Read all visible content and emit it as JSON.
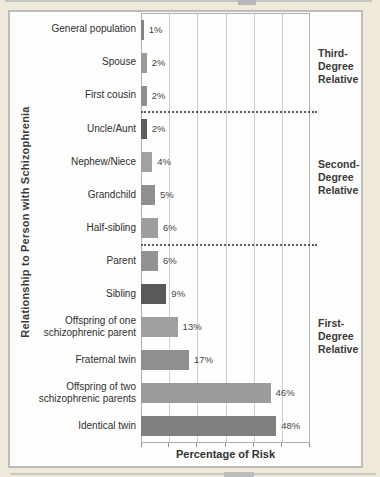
{
  "figure": {
    "page_background": "#efe9da",
    "panel_background": "#fdfdfb",
    "frame_border_color": "#bcbcbc",
    "gridline_color": "#cfcfcf"
  },
  "chart_data": {
    "type": "bar",
    "orientation": "horizontal",
    "title": "",
    "xlabel": "Percentage of Risk",
    "ylabel": "Relationship to Person with Schizophrenia",
    "xlim": [
      0,
      60
    ],
    "grid": true,
    "gridline_interval": 10,
    "axis_tick_labels_shown": false,
    "rows": [
      {
        "label": "General population",
        "value": 1,
        "value_label": "1%",
        "color": "#848484"
      },
      {
        "label": "Spouse",
        "value": 2,
        "value_label": "2%",
        "color": "#9b9b9b"
      },
      {
        "label": "First cousin",
        "value": 2,
        "value_label": "2%",
        "color": "#8e8e8e"
      },
      {
        "label": "Uncle/Aunt",
        "value": 2,
        "value_label": "2%",
        "color": "#5d5d5d"
      },
      {
        "label": "Nephew/Niece",
        "value": 4,
        "value_label": "4%",
        "color": "#a1a1a1"
      },
      {
        "label": "Grandchild",
        "value": 5,
        "value_label": "5%",
        "color": "#8f8f8f"
      },
      {
        "label": "Half-sibling",
        "value": 6,
        "value_label": "6%",
        "color": "#9d9d9d"
      },
      {
        "label": "Parent",
        "value": 6,
        "value_label": "6%",
        "color": "#929292"
      },
      {
        "label": "Sibling",
        "value": 9,
        "value_label": "9%",
        "color": "#595959"
      },
      {
        "label": "Offspring of one\nschizophrenic parent",
        "value": 13,
        "value_label": "13%",
        "color": "#a0a0a0"
      },
      {
        "label": "Fraternal twin",
        "value": 17,
        "value_label": "17%",
        "color": "#8f8f8f"
      },
      {
        "label": "Offspring of two\nschizophrenic parents",
        "value": 46,
        "value_label": "46%",
        "color": "#9b9b9b"
      },
      {
        "label": "Identical twin",
        "value": 48,
        "value_label": "48%",
        "color": "#7f7f7f"
      }
    ],
    "group_annotations": [
      {
        "label": "Third-\nDegree\nRelative",
        "top_px": 47
      },
      {
        "label": "Second-\nDegree\nRelative",
        "top_px": 158
      },
      {
        "label": "First-\nDegree\nRelative",
        "top_px": 317
      }
    ],
    "separators_after_rows": [
      2,
      6
    ],
    "legend": null
  }
}
